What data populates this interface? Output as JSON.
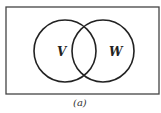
{
  "diagram": {
    "type": "venn",
    "sets": [
      {
        "label": "V"
      },
      {
        "label": "W"
      }
    ],
    "caption": "(a)",
    "colors": {
      "stroke": "#222222",
      "background": "#ffffff",
      "frame": "#444444"
    }
  }
}
